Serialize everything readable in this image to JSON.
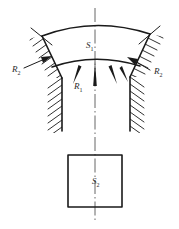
{
  "figure": {
    "type": "engineering-schematic",
    "background_color": "#ffffff",
    "line_color": "#1a1a1a",
    "centerline_color": "#555555"
  },
  "labels": {
    "arc_region": {
      "symbol": "S",
      "subscript": "1",
      "x": 88,
      "y": 48
    },
    "left_force": {
      "symbol": "R",
      "subscript": "2",
      "x": 14,
      "y": 70
    },
    "right_force": {
      "symbol": "R",
      "subscript": "2",
      "x": 156,
      "y": 70
    },
    "center_force": {
      "symbol": "R",
      "subscript": "1",
      "x": 76,
      "y": 87
    },
    "square_region": {
      "symbol": "S",
      "subscript": "2",
      "x": 94,
      "y": 182
    }
  },
  "geometry": {
    "centerline": {
      "x": 95,
      "y_top": 8,
      "y_bottom": 222
    },
    "outer_arc": "M 42,36 Q 95,16 150,34",
    "inner_arc": "M 52,67 Q 95,52 140,66",
    "left_edge": "M 42,36 L 62,78",
    "right_edge": "M 150,34 L 130,77",
    "left_channel_outer": "M 62,78 L 62,131",
    "left_channel_inner": "M 68,80 L 68,130",
    "right_channel_outer": "M 130,77 L 130,131",
    "right_channel_inner": "M 124,80 L 124,130",
    "square": {
      "x": 68,
      "y": 155,
      "width": 54,
      "height": 52
    }
  },
  "arrows": {
    "center_up": [
      {
        "x": 78,
        "angle": -22
      },
      {
        "x": 95,
        "angle": 0
      },
      {
        "x": 112,
        "angle": 22
      }
    ],
    "side": [
      {
        "name": "left-force-arrow",
        "direction": "up-right"
      },
      {
        "name": "right-force-arrow",
        "direction": "up-left"
      }
    ]
  }
}
